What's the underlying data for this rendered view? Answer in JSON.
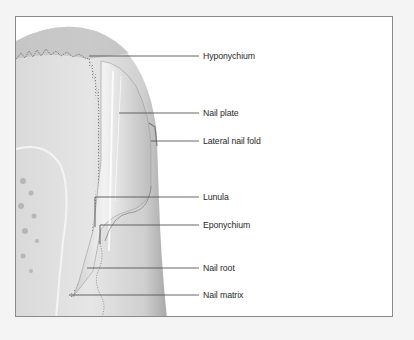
{
  "diagram": {
    "colors": {
      "background": "#f4f4f4",
      "frame_fill": "#ffffff",
      "frame_border": "#8a8a8a",
      "tissue_light": "#e2e2e2",
      "tissue_mid": "#c8c8c8",
      "tissue_dark": "#9a9a9a",
      "leader_line": "#555555",
      "label_text": "#2a2a2a"
    },
    "labels": [
      {
        "id": "hyponychium",
        "text": "Hyponychium"
      },
      {
        "id": "nail-plate",
        "text": "Nail plate"
      },
      {
        "id": "lateral-nail-fold",
        "text": "Lateral nail fold"
      },
      {
        "id": "lunula",
        "text": "Lunula"
      },
      {
        "id": "eponychium",
        "text": "Eponychium"
      },
      {
        "id": "nail-root",
        "text": "Nail root"
      },
      {
        "id": "nail-matrix",
        "text": "Nail matrix"
      }
    ]
  }
}
